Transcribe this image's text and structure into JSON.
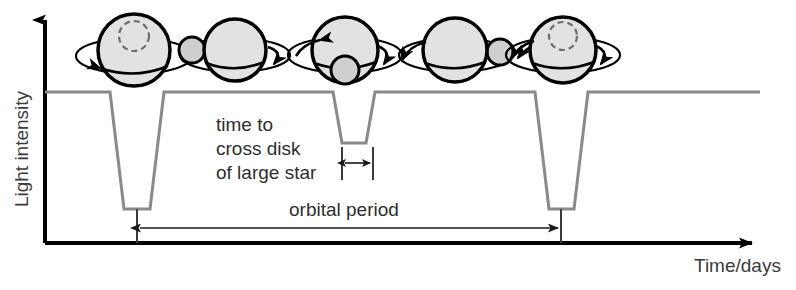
{
  "figure": {
    "background_color": "#ffffff"
  },
  "axes": {
    "y_label": "Light intensity",
    "x_label": "Time/days",
    "axis_color": "#000000",
    "origin": {
      "x": 45,
      "y": 243
    },
    "y_top": {
      "x": 45,
      "y": 14
    },
    "x_right": {
      "x": 760,
      "y": 243
    }
  },
  "annotations": {
    "transit_label_line1": "time to",
    "transit_label_line2": "cross disk",
    "transit_label_line3": "of large star",
    "period_label": "orbital period"
  },
  "chart_data": {
    "type": "line",
    "xlabel": "Time/days",
    "ylabel": "Light intensity",
    "curve_color": "#8a8a8a",
    "baseline_level": 92,
    "primary_minimum_level": 209,
    "secondary_minimum_level": 143,
    "grid": false,
    "legend": false,
    "points": [
      [
        45,
        92
      ],
      [
        110,
        92
      ],
      [
        124,
        209
      ],
      [
        150,
        209
      ],
      [
        164,
        92
      ],
      [
        333,
        92
      ],
      [
        342,
        143
      ],
      [
        366,
        143
      ],
      [
        375,
        92
      ],
      [
        535,
        92
      ],
      [
        549,
        209
      ],
      [
        574,
        209
      ],
      [
        588,
        92
      ],
      [
        760,
        92
      ]
    ],
    "primary_eclipse_centers": [
      137,
      561
    ],
    "secondary_eclipse_center": 354,
    "orbital_period_span": [
      137,
      561
    ],
    "transit_duration_span": [
      345,
      373
    ]
  },
  "stars": [
    {
      "name": "phase-1-companion-behind",
      "cx": 134,
      "cy": 50,
      "r": 36,
      "companion": {
        "cx": 134,
        "cy": 36,
        "r": 15,
        "hidden": true
      },
      "orbit_rx": 58,
      "orbit_ry": 18
    },
    {
      "name": "phase-2-companion-left",
      "cx": 235,
      "cy": 50,
      "r": 31,
      "companion": {
        "cx": 192,
        "cy": 50,
        "r": 13,
        "hidden": false
      },
      "orbit_rx": 55,
      "orbit_ry": 17
    },
    {
      "name": "phase-3-companion-front",
      "cx": 345,
      "cy": 50,
      "r": 33,
      "companion": {
        "cx": 345,
        "cy": 70,
        "r": 14,
        "hidden": false
      },
      "orbit_rx": 57,
      "orbit_ry": 18
    },
    {
      "name": "phase-4-companion-right",
      "cx": 455,
      "cy": 50,
      "r": 32,
      "companion": {
        "cx": 500,
        "cy": 52,
        "r": 13,
        "hidden": false
      },
      "orbit_rx": 56,
      "orbit_ry": 17
    },
    {
      "name": "phase-5-companion-behind",
      "cx": 563,
      "cy": 50,
      "r": 33,
      "companion": {
        "cx": 563,
        "cy": 36,
        "r": 14,
        "hidden": true
      },
      "orbit_rx": 57,
      "orbit_ry": 18
    }
  ],
  "colors": {
    "star_fill": "#e2e2e2",
    "star_outline": "#000000",
    "companion_fill": "#cfcfcf",
    "curve": "#8a8a8a",
    "text": "#2e2e2e",
    "arrow": "#1a1a1a"
  }
}
